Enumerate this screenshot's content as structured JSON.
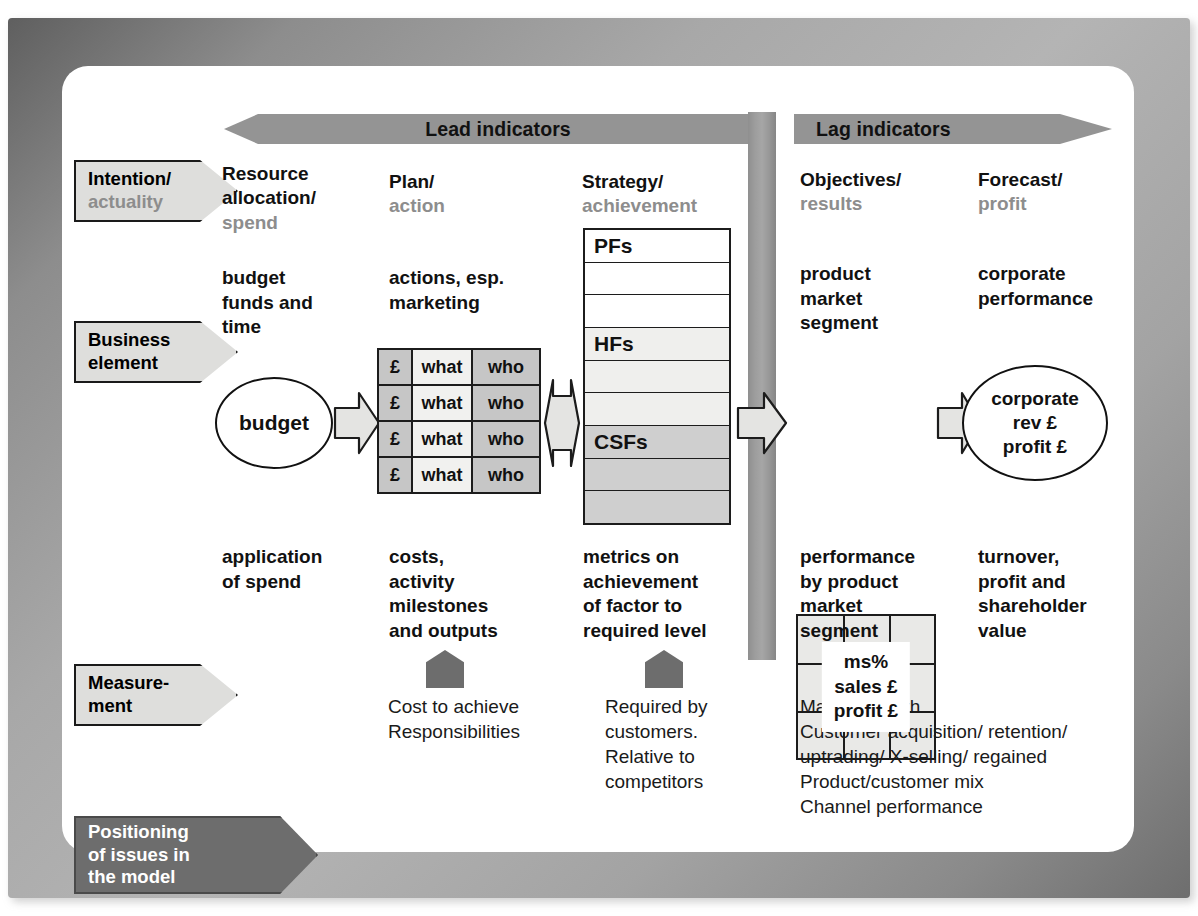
{
  "diagram": {
    "banners": {
      "lead": "Lead indicators",
      "lag": "Lag indicators"
    },
    "row_labels": [
      {
        "id": "intention",
        "line1": "Intention/",
        "line2": "actuality",
        "style": "light"
      },
      {
        "id": "business",
        "line1": "Business",
        "line2": "element",
        "style": "light"
      },
      {
        "id": "measurement",
        "line1": "Measure-",
        "line2": "ment",
        "style": "light"
      },
      {
        "id": "positioning",
        "line1": "Positioning",
        "line2": "of issues in",
        "line3": "the model",
        "style": "dark"
      }
    ],
    "columns": [
      {
        "id": "resource",
        "heading_bold": "Resource",
        "heading_bold2": "allocation/",
        "heading_gray": "spend",
        "business_element": "budget\nfunds and\ntime",
        "measurement": "application\nof spend",
        "positioning": ""
      },
      {
        "id": "plan",
        "heading_bold": "Plan/",
        "heading_gray": "action",
        "business_element": "actions, esp.\nmarketing",
        "measurement": "costs,\nactivity\nmilestones\nand outputs",
        "positioning": "Cost to achieve\nResponsibilities"
      },
      {
        "id": "strategy",
        "heading_bold": "Strategy/",
        "heading_gray": "achievement",
        "business_element": "",
        "measurement": "metrics on\nachievement\nof factor to\nrequired level",
        "positioning": "Required by\ncustomers.\nRelative to\ncompetitors"
      },
      {
        "id": "objectives",
        "heading_bold": "Objectives/",
        "heading_gray": "results",
        "business_element": "product\nmarket\nsegment",
        "measurement": "performance\nby product\nmarket\nsegment",
        "positioning": "Market growth\nCustomer acquisition/ retention/\nuptrading/ X-selling/ regained\nProduct/customer mix\nChannel performance"
      },
      {
        "id": "forecast",
        "heading_bold": "Forecast/",
        "heading_gray": "profit",
        "business_element": "corporate\nperformance",
        "measurement": "turnover,\nprofit and\nshareholder\nvalue",
        "positioning": ""
      }
    ],
    "budget_circle": "budget",
    "budget_table": {
      "headers": [
        "£",
        "what",
        "who"
      ],
      "rows": [
        [
          "£",
          "what",
          "who"
        ],
        [
          "£",
          "what",
          "who"
        ],
        [
          "£",
          "what",
          "who"
        ],
        [
          "£",
          "what",
          "who"
        ]
      ]
    },
    "factor_stack": {
      "labels": [
        "PFs",
        "HFs",
        "CSFs"
      ],
      "rows": [
        {
          "label": "PFs",
          "shade": "white"
        },
        {
          "label": "",
          "shade": "white"
        },
        {
          "label": "",
          "shade": "white"
        },
        {
          "label": "HFs",
          "shade": "light"
        },
        {
          "label": "",
          "shade": "light"
        },
        {
          "label": "",
          "shade": "light"
        },
        {
          "label": "CSFs",
          "shade": "mid"
        },
        {
          "label": "",
          "shade": "mid"
        },
        {
          "label": "",
          "shade": "mid"
        }
      ]
    },
    "ms_box": {
      "line1": "ms%",
      "line2": "sales £",
      "line3": "profit £"
    },
    "corporate_circle": {
      "line1": "corporate",
      "line2": "rev £",
      "line3": "profit £"
    },
    "colors": {
      "banner_gray": "#949494",
      "chevron_light": "#dededc",
      "chevron_dark": "#6d6d6d",
      "cell_mid": "#c6c6c6",
      "cell_light": "#f1f1ef",
      "stack_light": "#efefed",
      "stack_mid": "#cfcfcf",
      "sub_text_gray": "#8d8d8d",
      "outline": "#1c1c1c"
    }
  }
}
